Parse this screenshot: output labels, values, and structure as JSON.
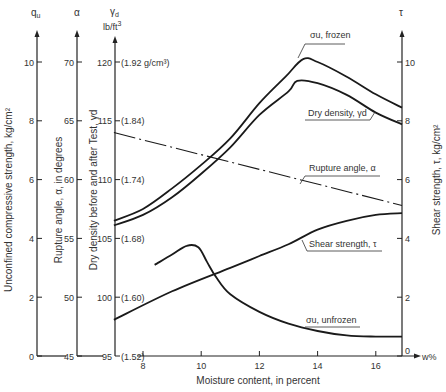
{
  "chart_data": {
    "type": "line",
    "title": "",
    "xlabel": "Moisture content, in percent",
    "x_axis_end_label": "w%",
    "x_ticks": [
      8,
      10,
      12,
      14,
      16
    ],
    "xlim": [
      7.0,
      16.9
    ],
    "axes": {
      "qu": {
        "header": "q_u",
        "label": "Unconfined compressive strength, kg/cm²",
        "ticks": [
          0,
          2,
          4,
          6,
          8,
          10
        ],
        "ylim": [
          0,
          10
        ]
      },
      "alpha": {
        "header": "α",
        "label": "Rupture angle, α, in degrees",
        "ticks": [
          45,
          50,
          55,
          60,
          65,
          70
        ],
        "ylim": [
          45,
          70
        ]
      },
      "gamma_d": {
        "header": "γd",
        "unit": "lb/ft³",
        "label": "Dry density before and after Test, γd",
        "ticks": [
          95,
          100,
          105,
          110,
          115,
          120
        ],
        "secondary_ticks": [
          "(1.52)",
          "(1.60)",
          "(1.68)",
          "(1.74)",
          "(1.84)",
          "(1.92 g/cm³)"
        ],
        "ylim": [
          95,
          120
        ]
      },
      "tau": {
        "header": "τ",
        "label": "Shear strength, τ, kg/cm²",
        "ticks": [
          0,
          2,
          4,
          6,
          8,
          10
        ],
        "ylim": [
          0,
          10
        ]
      }
    },
    "series": [
      {
        "name": "σu, frozen",
        "axis": "qu",
        "style": "solid-bold",
        "x": [
          7.0,
          8,
          9,
          10,
          11,
          12,
          12.9,
          13.5,
          14,
          15,
          16,
          16.9
        ],
        "values": [
          4.6,
          5.0,
          5.7,
          6.5,
          7.4,
          8.6,
          9.5,
          10.1,
          10.0,
          9.5,
          8.9,
          8.45
        ]
      },
      {
        "name": "Dry density, γd",
        "axis": "gamma_d",
        "style": "solid-bold",
        "x": [
          7.0,
          8,
          9,
          10,
          11,
          12,
          13,
          13.3,
          14,
          15,
          16,
          16.9
        ],
        "values": [
          106.1,
          107.0,
          108.5,
          110.5,
          112.75,
          115.5,
          117.5,
          118.4,
          118.2,
          117.2,
          115.7,
          114.7
        ]
      },
      {
        "name": "Rupture angle, α",
        "axis": "alpha",
        "style": "dash-dot",
        "x": [
          7.0,
          16.9
        ],
        "values": [
          64.0,
          57.8
        ]
      },
      {
        "name": "Shear strength, τ",
        "axis": "tau",
        "style": "solid-bold",
        "x": [
          7.0,
          9,
          11,
          12,
          13,
          14,
          15,
          16,
          16.9
        ],
        "values": [
          1.23,
          2.2,
          3.0,
          3.4,
          3.8,
          4.3,
          4.6,
          4.8,
          4.86
        ]
      },
      {
        "name": "σu, unfrozen",
        "axis": "qu",
        "style": "solid-bold",
        "x": [
          8.4,
          9,
          9.5,
          9.9,
          10.2,
          10.5,
          11,
          12,
          13,
          14,
          15,
          16,
          16.9
        ],
        "values": [
          3.1,
          3.45,
          3.75,
          3.7,
          3.2,
          2.7,
          2.1,
          1.5,
          1.1,
          0.85,
          0.7,
          0.66,
          0.66
        ]
      }
    ],
    "annotations": [
      {
        "text": "σu, frozen",
        "x": 13.5,
        "y_tau": 11.0
      },
      {
        "text": "Dry density, γd",
        "x": 15.3,
        "y_tau": 7.9
      },
      {
        "text": "Rupture angle, α",
        "x": 15.0,
        "y_tau": 6.3
      },
      {
        "text": "Shear strength, τ",
        "x": 15.0,
        "y_tau": 3.7
      },
      {
        "text": "σu, unfrozen",
        "x": 14.5,
        "y_tau": 1.3
      }
    ],
    "grid": false,
    "legend": "inline labels"
  },
  "labels": {
    "qu_header": "q",
    "qu_header_sub": "u",
    "alpha_header": "α",
    "gamma_header": "γ",
    "gamma_header_sub": "d",
    "gamma_unit": "lb/ft",
    "gamma_unit_sup": "3",
    "tau_header": "τ",
    "qu_axis_label": "Unconfined compressive strength, kg/cm²",
    "alpha_axis_label": "Rupture angle, α, in degrees",
    "gamma_axis_label": "Dry density before and after Test, γd",
    "tau_axis_label": "Shear strength, τ, kg/cm²",
    "x_axis_label": "Moisture content, in percent",
    "x_axis_end": "w%",
    "frozen_label": "σu, frozen",
    "density_label": "Dry density, γd",
    "rupture_label": "Rupture angle, α",
    "shear_label": "Shear strength, τ",
    "unfrozen_label": "σu, unfrozen"
  }
}
